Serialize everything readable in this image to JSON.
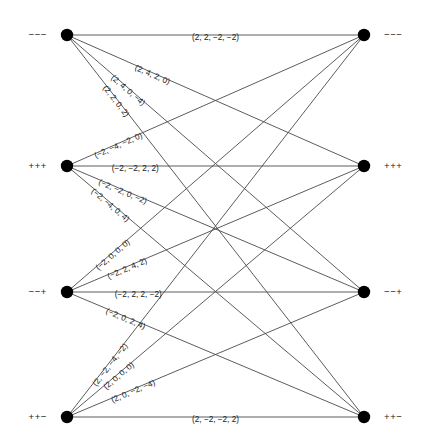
{
  "figure": {
    "width": 422,
    "height": 446,
    "background_color": "#ffffff",
    "edge_color": "#4a4a4a",
    "node_color": "#000000",
    "text_color": "#1a1a1a"
  },
  "nodes": {
    "left": [
      {
        "id": "L1",
        "sign_label": "−−−",
        "x": 67,
        "y": 35
      },
      {
        "id": "L2",
        "sign_label": "+++",
        "x": 67,
        "y": 166
      },
      {
        "id": "L3",
        "sign_label": "−−+",
        "x": 67,
        "y": 292
      },
      {
        "id": "L4",
        "sign_label": "++−",
        "x": 67,
        "y": 417
      }
    ],
    "right": [
      {
        "id": "R1",
        "sign_label": "−−−",
        "x": 364,
        "y": 35
      },
      {
        "id": "R2",
        "sign_label": "+++",
        "x": 364,
        "y": 166
      },
      {
        "id": "R3",
        "sign_label": "−−+",
        "x": 364,
        "y": 292
      },
      {
        "id": "R4",
        "sign_label": "++−",
        "x": 364,
        "y": 417
      }
    ]
  },
  "edges": [
    {
      "id": "e-L1-R1",
      "from": "L1",
      "to": "R1",
      "label": "(2, 2, −2, −2)",
      "label_t": 0.5,
      "label_offset": -4.5
    },
    {
      "id": "e-L1-R2",
      "from": "L1",
      "to": "R2",
      "label": "(2, 4, 2, 0)",
      "label_t": 0.29,
      "label_offset": -4.5
    },
    {
      "id": "e-L1-R3",
      "from": "L1",
      "to": "R3",
      "label": "(2, 4, 0, −4)",
      "label_t": 0.21,
      "label_offset": -4.5
    },
    {
      "id": "e-L1-R4",
      "from": "L1",
      "to": "R4",
      "label": "(2, 2, 0, 2)",
      "label_t": 0.17,
      "label_offset": -4.5
    },
    {
      "id": "e-L2-R1",
      "from": "L2",
      "to": "R1",
      "label": "(−2, −4, −2, 0)",
      "label_t": 0.17,
      "label_offset": -4.5
    },
    {
      "id": "e-L2-R2",
      "from": "L2",
      "to": "R2",
      "label": "(−2, −2, 2, 2)",
      "label_t": 0.23,
      "label_offset": -4.5
    },
    {
      "id": "e-L2-R3",
      "from": "L2",
      "to": "R3",
      "label": "(−2, −2, 0, −2)",
      "label_t": 0.19,
      "label_offset": -4.5
    },
    {
      "id": "e-L2-R4",
      "from": "L2",
      "to": "R4",
      "label": "(−2, −4, 0, 4)",
      "label_t": 0.15,
      "label_offset": -4.5
    },
    {
      "id": "e-L3-R1",
      "from": "L3",
      "to": "R1",
      "label": "(−2, 0, 0, 0)",
      "label_t": 0.15,
      "label_offset": -4.5
    },
    {
      "id": "e-L3-R2",
      "from": "L3",
      "to": "R2",
      "label": "(−2, 2, 4, 2)",
      "label_t": 0.2,
      "label_offset": -4.5
    },
    {
      "id": "e-L3-R3",
      "from": "L3",
      "to": "R3",
      "label": "(−2, 2, 2, −2)",
      "label_t": 0.24,
      "label_offset": -4.5
    },
    {
      "id": "e-L3-R4",
      "from": "L3",
      "to": "R4",
      "label": "(−2, 0, 2, 4)",
      "label_t": 0.2,
      "label_offset": -4.5
    },
    {
      "id": "e-L4-R1",
      "from": "L4",
      "to": "R1",
      "label": "(2, −2, −4, −2)",
      "label_t": 0.14,
      "label_offset": -4.5
    },
    {
      "id": "e-L4-R2",
      "from": "L4",
      "to": "R2",
      "label": "(2, 0, 0, 0)",
      "label_t": 0.17,
      "label_offset": -4.5
    },
    {
      "id": "e-L4-R3",
      "from": "L4",
      "to": "R3",
      "label": "(2, 0, −2, −4)",
      "label_t": 0.22,
      "label_offset": -4.5
    },
    {
      "id": "e-L4-R4",
      "from": "L4",
      "to": "R4",
      "label": "(2, −2, −2, 2)",
      "label_t": 0.5,
      "label_offset": -4.5
    }
  ],
  "node_radius": 6.2,
  "sign_label_gap": 20
}
